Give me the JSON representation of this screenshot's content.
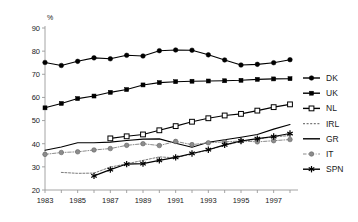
{
  "chart_data": {
    "type": "line",
    "title": "",
    "subtitle": "",
    "xlabel": "",
    "ylabel": "",
    "unit_label": "%",
    "ylim": [
      20,
      90
    ],
    "xlim": [
      1983,
      1998
    ],
    "ytick_labels": [
      "20",
      "30",
      "40",
      "50",
      "60",
      "70",
      "80",
      "90"
    ],
    "ytick_values": [
      20,
      30,
      40,
      50,
      60,
      70,
      80,
      90
    ],
    "xtick_labels": [
      "1983",
      "1985",
      "1987",
      "1989",
      "1991",
      "1993",
      "1995",
      "1997"
    ],
    "xtick_values": [
      1983,
      1985,
      1987,
      1989,
      1991,
      1993,
      1995,
      1997
    ],
    "x_minor_ticks": [
      1983,
      1984,
      1985,
      1986,
      1987,
      1988,
      1989,
      1990,
      1991,
      1992,
      1993,
      1994,
      1995,
      1996,
      1997,
      1998
    ],
    "grid": false,
    "legend_position": "right",
    "series": [
      {
        "name": "DK",
        "marker": "filled-circle",
        "line_style": "solid",
        "color": "#000000",
        "x": [
          1983,
          1984,
          1985,
          1986,
          1987,
          1988,
          1989,
          1990,
          1991,
          1992,
          1993,
          1994,
          1995,
          1996,
          1997,
          1998
        ],
        "values": [
          75.1,
          73.8,
          75.6,
          77.1,
          76.7,
          78.2,
          77.9,
          80.2,
          80.5,
          80.4,
          78.4,
          76.2,
          74.0,
          74.3,
          75.0,
          76.3
        ]
      },
      {
        "name": "UK",
        "marker": "filled-square",
        "line_style": "solid",
        "color": "#000000",
        "x": [
          1983,
          1984,
          1985,
          1986,
          1987,
          1988,
          1989,
          1990,
          1991,
          1992,
          1993,
          1994,
          1995,
          1996,
          1997,
          1998
        ],
        "values": [
          55.5,
          57.4,
          59.5,
          60.6,
          62.2,
          63.4,
          65.4,
          66.4,
          66.8,
          67.0,
          67.1,
          67.2,
          67.4,
          67.8,
          68.0,
          68.1
        ]
      },
      {
        "name": "NL",
        "marker": "open-square",
        "line_style": "solid",
        "color": "#000000",
        "x": [
          1987,
          1988,
          1989,
          1990,
          1991,
          1992,
          1993,
          1994,
          1995,
          1996,
          1997,
          1998
        ],
        "values": [
          42.3,
          43.2,
          44.0,
          45.8,
          47.6,
          49.5,
          51.0,
          52.2,
          52.9,
          54.3,
          55.8,
          57.0
        ]
      },
      {
        "name": "IRL",
        "marker": "none",
        "line_style": "dotted",
        "color": "#7a7a7a",
        "x": [
          1984,
          1985,
          1986,
          1987,
          1988,
          1989,
          1990,
          1991,
          1992,
          1993,
          1994,
          1995,
          1996,
          1997,
          1998
        ],
        "values": [
          27.6,
          27.2,
          27.3,
          29.9,
          31.3,
          32.8,
          34.3,
          33.9,
          35.6,
          37.3,
          39.3,
          41.0,
          42.0,
          43.0,
          43.5
        ]
      },
      {
        "name": "GR",
        "marker": "none",
        "line_style": "solid",
        "color": "#000000",
        "x": [
          1983,
          1984,
          1985,
          1986,
          1987,
          1988,
          1989,
          1990,
          1991,
          1992,
          1993,
          1994,
          1995,
          1996,
          1997,
          1998
        ],
        "values": [
          37.2,
          38.6,
          40.4,
          40.4,
          40.7,
          41.4,
          42.0,
          42.1,
          40.2,
          38.5,
          40.6,
          41.7,
          42.8,
          44.0,
          46.3,
          48.3
        ]
      },
      {
        "name": "IT",
        "marker": "gray-circle",
        "line_style": "dash-dot",
        "color": "#8c8c8c",
        "x": [
          1983,
          1984,
          1985,
          1986,
          1987,
          1988,
          1989,
          1990,
          1991,
          1992,
          1993,
          1994,
          1995,
          1996,
          1997,
          1998
        ],
        "values": [
          35.4,
          36.2,
          36.5,
          37.3,
          37.9,
          39.3,
          40.0,
          39.2,
          41.0,
          39.6,
          40.4,
          40.8,
          41.2,
          40.8,
          41.3,
          41.8
        ]
      },
      {
        "name": "SPN",
        "marker": "star",
        "line_style": "solid",
        "color": "#000000",
        "x": [
          1986,
          1987,
          1988,
          1989,
          1990,
          1991,
          1992,
          1993,
          1994,
          1995,
          1996,
          1997,
          1998
        ],
        "values": [
          26.1,
          28.8,
          31.2,
          31.4,
          32.8,
          34.1,
          35.8,
          37.4,
          39.5,
          41.2,
          42.2,
          43.1,
          44.4
        ]
      }
    ]
  },
  "legend": {
    "entries": [
      {
        "label": "DK"
      },
      {
        "label": "UK"
      },
      {
        "label": "NL"
      },
      {
        "label": "IRL"
      },
      {
        "label": "GR"
      },
      {
        "label": "IT"
      },
      {
        "label": "SPN"
      }
    ]
  }
}
